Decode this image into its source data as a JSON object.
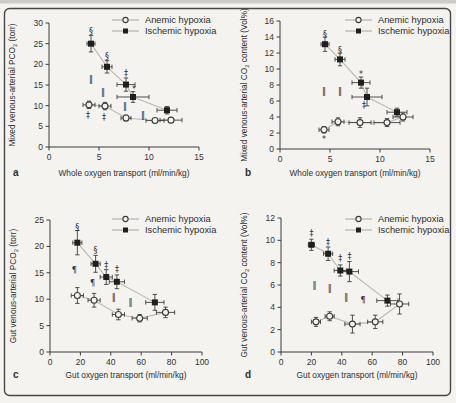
{
  "figure": {
    "background": "#f4f3f0",
    "border_color": "#474747",
    "paper_edge_color": "#cfccc7",
    "marker_color": "#1f1f1f",
    "connect_line_color": "#bcb8b2",
    "axis_color": "#3d3d3d"
  },
  "chart_data": [
    {
      "id": "a",
      "panel_label": "a",
      "type": "scatter",
      "xlabel": "Whole oxygen transport (ml/min/kg)",
      "ylabel_parts": [
        {
          "text": "Mixed venous-arterial PCO"
        },
        {
          "text": "2",
          "sub": true
        },
        {
          "text": " (torr)"
        }
      ],
      "xlim": [
        0,
        15
      ],
      "ylim": [
        0,
        30
      ],
      "xticks": [
        0,
        5,
        10,
        15
      ],
      "yticks": [
        0,
        5,
        10,
        15,
        20,
        25,
        30
      ],
      "legend_position": "top-right",
      "series": [
        {
          "name": "Anemic hypoxia",
          "marker": "open-circle",
          "points": [
            {
              "x": 4.0,
              "y": 10.2,
              "ex": 0.6,
              "ey": 0.9
            },
            {
              "x": 5.6,
              "y": 9.9,
              "ex": 0.6,
              "ey": 0.9
            },
            {
              "x": 7.7,
              "y": 7.0,
              "ex": 0.5,
              "ey": 0.7
            },
            {
              "x": 10.6,
              "y": 6.4,
              "ex": 0.9,
              "ey": 0.4
            },
            {
              "x": 12.2,
              "y": 6.5,
              "ex": 1.1,
              "ey": 0.4
            }
          ]
        },
        {
          "name": "Ischemic hypoxia",
          "marker": "filled-square",
          "points": [
            {
              "x": 4.2,
              "y": 25.0,
              "ex": 0.4,
              "ey": 2.0
            },
            {
              "x": 5.8,
              "y": 19.4,
              "ex": 0.5,
              "ey": 1.5
            },
            {
              "x": 7.7,
              "y": 15.1,
              "ex": 0.9,
              "ey": 1.6
            },
            {
              "x": 8.4,
              "y": 12.1,
              "ex": 1.6,
              "ey": 1.3
            },
            {
              "x": 11.8,
              "y": 8.9,
              "ex": 1.0,
              "ey": 0.9
            }
          ]
        }
      ],
      "annotations": [
        {
          "sym": "§",
          "x": 4.2,
          "y": 27.9
        },
        {
          "sym": "§",
          "x": 5.8,
          "y": 22.0
        },
        {
          "sym": "‡",
          "x": 7.7,
          "y": 17.8
        },
        {
          "sym": "*",
          "x": 8.5,
          "y": 14.1
        },
        {
          "sym": "‖",
          "x": 4.2,
          "y": 16.4
        },
        {
          "sym": "‖",
          "x": 5.4,
          "y": 13.2
        },
        {
          "sym": "‖",
          "x": 7.6,
          "y": 9.8
        },
        {
          "sym": "‖",
          "x": 9.4,
          "y": 7.6
        },
        {
          "sym": "‡",
          "x": 3.9,
          "y": 7.6
        },
        {
          "sym": "‡",
          "x": 5.5,
          "y": 7.3
        }
      ]
    },
    {
      "id": "b",
      "panel_label": "b",
      "type": "scatter",
      "xlabel": "Whole oxygen transport (ml/min/kg)",
      "ylabel_parts": [
        {
          "text": "Mixed venous-arterial CO"
        },
        {
          "text": "2",
          "sub": true
        },
        {
          "text": " content (Vol%)"
        }
      ],
      "xlim": [
        0,
        15
      ],
      "ylim": [
        0,
        16
      ],
      "xticks": [
        0,
        5,
        10,
        15
      ],
      "yticks": [
        0,
        2,
        4,
        6,
        8,
        10,
        12,
        14,
        16
      ],
      "legend_position": "top-right",
      "series": [
        {
          "name": "Anemic hypoxia",
          "marker": "open-circle",
          "points": [
            {
              "x": 4.4,
              "y": 2.4,
              "ex": 0.5,
              "ey": 0.4
            },
            {
              "x": 5.8,
              "y": 3.4,
              "ex": 0.6,
              "ey": 0.5
            },
            {
              "x": 8.0,
              "y": 3.3,
              "ex": 1.1,
              "ey": 0.6
            },
            {
              "x": 10.7,
              "y": 3.3,
              "ex": 1.3,
              "ey": 0.5
            },
            {
              "x": 12.3,
              "y": 4.0,
              "ex": 1.0,
              "ey": 0.5
            }
          ]
        },
        {
          "name": "Ischemic hypoxia",
          "marker": "filled-square",
          "points": [
            {
              "x": 4.5,
              "y": 13.1,
              "ex": 0.4,
              "ey": 0.9
            },
            {
              "x": 6.0,
              "y": 11.2,
              "ex": 0.5,
              "ey": 0.8
            },
            {
              "x": 8.1,
              "y": 8.3,
              "ex": 0.9,
              "ey": 0.7
            },
            {
              "x": 8.7,
              "y": 6.5,
              "ex": 1.5,
              "ey": 1.1
            },
            {
              "x": 11.7,
              "y": 4.6,
              "ex": 1.0,
              "ey": 0.5
            }
          ]
        }
      ],
      "annotations": [
        {
          "sym": "§",
          "x": 4.5,
          "y": 14.4
        },
        {
          "sym": "§",
          "x": 6.0,
          "y": 12.4
        },
        {
          "sym": "*",
          "x": 8.1,
          "y": 9.4
        },
        {
          "sym": "‖",
          "x": 4.4,
          "y": 7.2
        },
        {
          "sym": "‖",
          "x": 6.0,
          "y": 7.2
        },
        {
          "sym": "‡",
          "x": 8.4,
          "y": 5.5
        },
        {
          "sym": "*",
          "x": 4.4,
          "y": 1.2
        }
      ]
    },
    {
      "id": "c",
      "panel_label": "c",
      "type": "scatter",
      "xlabel": "Gut oxygen transport (ml/min/kg)",
      "ylabel_parts": [
        {
          "text": "Gut venous-arterial PCO"
        },
        {
          "text": "2",
          "sub": true
        },
        {
          "text": " (torr)"
        }
      ],
      "xlim": [
        0,
        100
      ],
      "ylim": [
        0,
        25
      ],
      "xticks": [
        0,
        20,
        40,
        60,
        80,
        100
      ],
      "yticks": [
        0,
        5,
        10,
        15,
        20,
        25
      ],
      "legend_position": "top-right",
      "series": [
        {
          "name": "Anemic hypoxia",
          "marker": "open-circle",
          "points": [
            {
              "x": 18,
              "y": 10.7,
              "ex": 4,
              "ey": 1.5
            },
            {
              "x": 29,
              "y": 9.8,
              "ex": 4,
              "ey": 1.3
            },
            {
              "x": 45,
              "y": 7.1,
              "ex": 4,
              "ey": 1.0
            },
            {
              "x": 59,
              "y": 6.4,
              "ex": 5,
              "ey": 0.7
            },
            {
              "x": 76,
              "y": 7.5,
              "ex": 6,
              "ey": 1.0
            }
          ]
        },
        {
          "name": "Ischemic hypoxia",
          "marker": "filled-square",
          "points": [
            {
              "x": 18,
              "y": 20.7,
              "ex": 3,
              "ey": 2.3
            },
            {
              "x": 30,
              "y": 16.7,
              "ex": 3,
              "ey": 1.6
            },
            {
              "x": 37,
              "y": 14.2,
              "ex": 4,
              "ey": 1.4
            },
            {
              "x": 44,
              "y": 13.3,
              "ex": 5,
              "ey": 1.3
            },
            {
              "x": 69,
              "y": 9.4,
              "ex": 6,
              "ey": 1.5
            }
          ]
        }
      ],
      "annotations": [
        {
          "sym": "§",
          "x": 18,
          "y": 23.7
        },
        {
          "sym": "§",
          "x": 30,
          "y": 19.3
        },
        {
          "sym": "‡",
          "x": 37,
          "y": 16.4
        },
        {
          "sym": "‡",
          "x": 44,
          "y": 15.7
        },
        {
          "sym": "¶",
          "x": 16,
          "y": 15.5
        },
        {
          "sym": "¶",
          "x": 28,
          "y": 13.0
        },
        {
          "sym": "‖",
          "x": 42,
          "y": 10.4
        },
        {
          "sym": "‖",
          "x": 53,
          "y": 9.5
        }
      ]
    },
    {
      "id": "d",
      "panel_label": "d",
      "type": "scatter",
      "xlabel": "Gut oxygen transport (ml/min/kg)",
      "ylabel_parts": [
        {
          "text": "Gut venous-arterial CO"
        },
        {
          "text": "2",
          "sub": true
        },
        {
          "text": " content (Vol%)"
        }
      ],
      "xlim": [
        0,
        100
      ],
      "ylim": [
        0,
        12
      ],
      "xticks": [
        0,
        20,
        40,
        60,
        80,
        100
      ],
      "yticks": [
        0,
        2,
        4,
        6,
        8,
        10,
        12
      ],
      "legend_position": "top-right",
      "series": [
        {
          "name": "Anemic hypoxia",
          "marker": "open-circle",
          "points": [
            {
              "x": 23,
              "y": 2.7,
              "ex": 3,
              "ey": 0.4
            },
            {
              "x": 32,
              "y": 3.2,
              "ex": 3,
              "ey": 0.4
            },
            {
              "x": 47,
              "y": 2.5,
              "ex": 5,
              "ey": 0.8
            },
            {
              "x": 62,
              "y": 2.7,
              "ex": 5,
              "ey": 0.6
            },
            {
              "x": 78,
              "y": 4.3,
              "ex": 6,
              "ey": 0.9
            }
          ]
        },
        {
          "name": "Ischemic hypoxia",
          "marker": "filled-square",
          "points": [
            {
              "x": 20,
              "y": 9.6,
              "ex": 2,
              "ey": 0.5
            },
            {
              "x": 31,
              "y": 8.8,
              "ex": 3,
              "ey": 0.6
            },
            {
              "x": 39,
              "y": 7.3,
              "ex": 4,
              "ey": 0.5
            },
            {
              "x": 45,
              "y": 7.2,
              "ex": 6,
              "ey": 0.9
            },
            {
              "x": 70,
              "y": 4.6,
              "ex": 7,
              "ey": 0.5
            }
          ]
        }
      ],
      "annotations": [
        {
          "sym": "‡",
          "x": 20,
          "y": 10.6
        },
        {
          "sym": "‡",
          "x": 31,
          "y": 9.8
        },
        {
          "sym": "‡",
          "x": 39,
          "y": 8.4
        },
        {
          "sym": "‡",
          "x": 45,
          "y": 8.6
        },
        {
          "sym": "‖",
          "x": 22,
          "y": 6.0
        },
        {
          "sym": "‖",
          "x": 32,
          "y": 5.7
        },
        {
          "sym": "‖",
          "x": 43,
          "y": 4.9
        },
        {
          "sym": "¶",
          "x": 54,
          "y": 4.6
        }
      ]
    }
  ]
}
